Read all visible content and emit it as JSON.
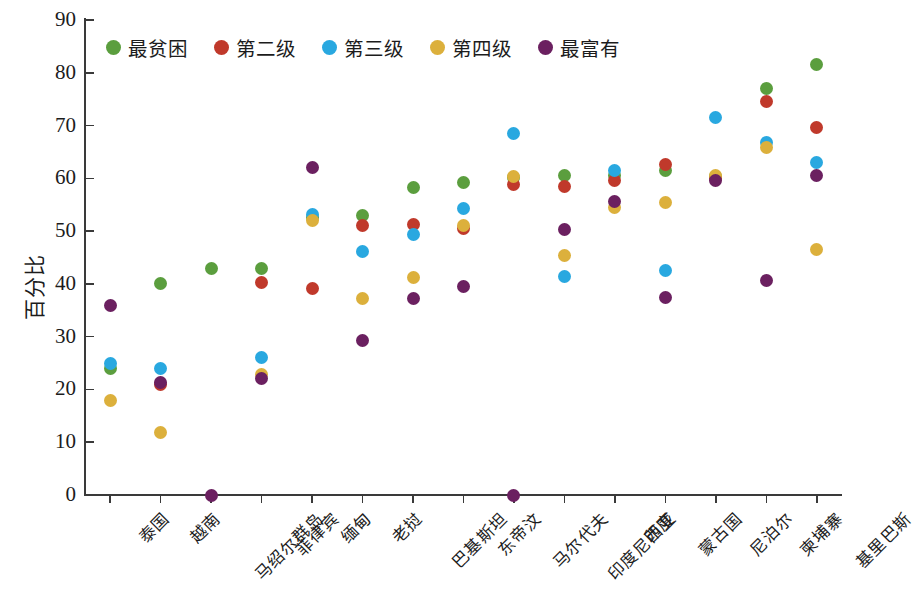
{
  "chart_data": {
    "type": "scatter",
    "title": "",
    "xlabel": "",
    "ylabel": "百分比",
    "ylim": [
      0,
      90
    ],
    "ytick_labels": [
      "0",
      "10",
      "20",
      "30",
      "40",
      "50",
      "60",
      "70",
      "80",
      "90"
    ],
    "ytick_values": [
      0,
      10,
      20,
      30,
      40,
      50,
      60,
      70,
      80,
      90
    ],
    "grid": false,
    "legend_position": "top-left-inside",
    "categories": [
      "泰国",
      "越南",
      "马绍尔群岛",
      "菲律宾",
      "缅甸",
      "老挝",
      "巴基斯坦",
      "东帝汶",
      "马尔代夫",
      "印度尼西亚",
      "印度",
      "蒙古国",
      "尼泊尔",
      "柬埔寨",
      "基里巴斯"
    ],
    "series": [
      {
        "name": "最贫困",
        "color": "#5b9e3e",
        "values": [
          24.0,
          40.0,
          43.0,
          43.0,
          52.5,
          53.0,
          58.2,
          59.3,
          60.2,
          60.5,
          60.6,
          61.5,
          60.3,
          77.0,
          81.6
        ]
      },
      {
        "name": "第二级",
        "color": "#c0392b",
        "values": [
          null,
          21.0,
          null,
          40.2,
          39.2,
          51.0,
          51.2,
          50.5,
          58.8,
          58.5,
          59.6,
          62.6,
          60.0,
          74.6,
          69.7
        ]
      },
      {
        "name": "第三级",
        "color": "#29a8e0",
        "values": [
          25.0,
          24.0,
          null,
          26.1,
          53.2,
          46.2,
          49.3,
          54.2,
          68.5,
          41.4,
          61.5,
          42.6,
          71.6,
          66.8,
          63.0
        ]
      },
      {
        "name": "第四级",
        "color": "#dcb03c",
        "values": [
          18.0,
          11.9,
          null,
          22.8,
          52.0,
          37.3,
          41.3,
          51.0,
          60.4,
          45.4,
          54.4,
          55.5,
          60.6,
          65.9,
          46.6
        ]
      },
      {
        "name": "最富有",
        "color": "#6b2060",
        "values": [
          35.9,
          21.3,
          0.0,
          22.1,
          62.0,
          29.3,
          37.2,
          39.5,
          0.0,
          50.4,
          55.7,
          37.5,
          59.6,
          40.7,
          60.6
        ]
      }
    ]
  },
  "legend": {
    "items": [
      {
        "label": "最贫困",
        "color": "#5b9e3e"
      },
      {
        "label": "第二级",
        "color": "#c0392b"
      },
      {
        "label": "第三级",
        "color": "#29a8e0"
      },
      {
        "label": "第四级",
        "color": "#dcb03c"
      },
      {
        "label": "最富有",
        "color": "#6b2060"
      }
    ]
  },
  "axes": {
    "y_axis_title": "百分比"
  }
}
